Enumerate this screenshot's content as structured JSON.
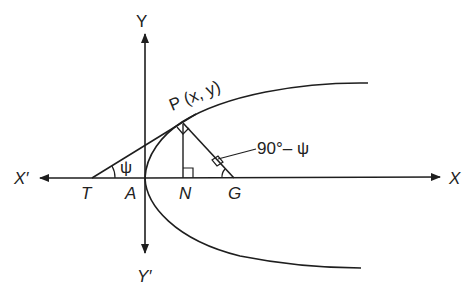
{
  "diagram": {
    "type": "parabola-tangent-normal",
    "colors": {
      "stroke": "#1e1e1e",
      "background": "#ffffff"
    },
    "labels": {
      "y_axis_pos": "Y",
      "y_axis_neg": "Y′",
      "x_axis_pos": "X",
      "x_axis_neg": "X′",
      "point_p": "P (x, y)",
      "point_t": "T",
      "point_a": "A",
      "point_n": "N",
      "point_g": "G",
      "angle_psi": "ψ",
      "angle_complement": "90°– ψ"
    },
    "elements": [
      "parabola with vertex A at origin opening right",
      "tangent line from T through P",
      "ordinate PN perpendicular to x-axis",
      "normal line PG",
      "right angle marks at P, N, and near G",
      "angle ψ at T between tangent and x-axis",
      "angle 90° − ψ at G"
    ]
  }
}
